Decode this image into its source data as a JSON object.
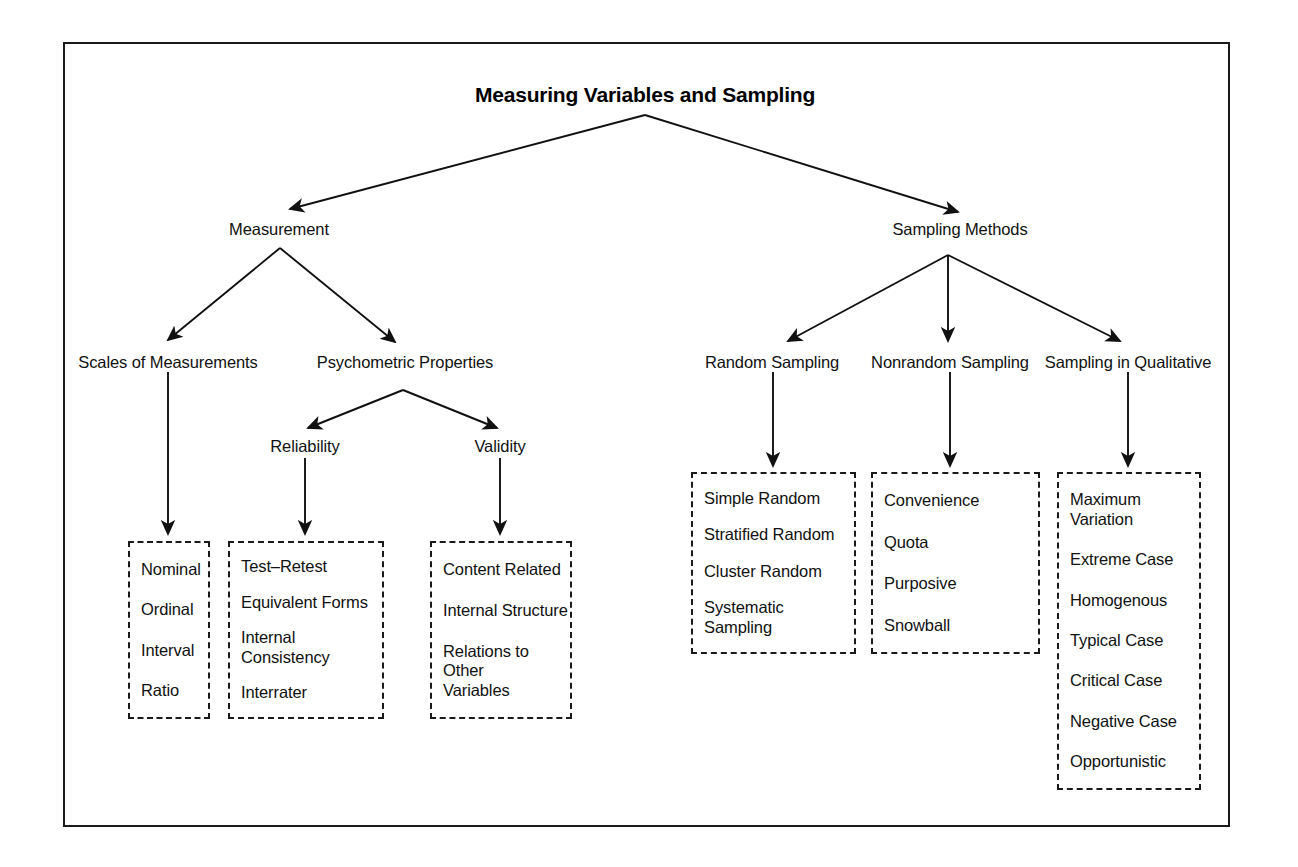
{
  "diagram": {
    "title": "Measuring Variables and Sampling",
    "nodes": {
      "measurement": "Measurement",
      "sampling_methods": "Sampling Methods",
      "scales_of_measurements": "Scales of Measurements",
      "psychometric_properties": "Psychometric Properties",
      "reliability": "Reliability",
      "validity": "Validity",
      "random_sampling": "Random Sampling",
      "nonrandom_sampling": "Nonrandom Sampling",
      "sampling_in_qualitative": "Sampling in Qualitative"
    },
    "boxes": {
      "scales": {
        "name": "Scales of Measurements",
        "items": [
          "Nominal",
          "Ordinal",
          "Interval",
          "Ratio"
        ]
      },
      "reliability": {
        "name": "Reliability",
        "items": [
          "Test–Retest",
          "Equivalent Forms",
          "Internal Consistency",
          "Interrater"
        ]
      },
      "validity": {
        "name": "Validity",
        "items": [
          "Content Related",
          "Internal Structure",
          "Relations to Other\nVariables"
        ]
      },
      "random": {
        "name": "Random Sampling",
        "items": [
          "Simple Random",
          "Stratified Random",
          "Cluster Random",
          "Systematic Sampling"
        ]
      },
      "nonrandom": {
        "name": "Nonrandom Sampling",
        "items": [
          "Convenience",
          "Quota",
          "Purposive",
          "Snowball"
        ]
      },
      "qualitative": {
        "name": "Sampling in Qualitative",
        "items": [
          "Maximum Variation",
          "Extreme Case",
          "Homogenous",
          "Typical Case",
          "Critical Case",
          "Negative Case",
          "Opportunistic"
        ]
      }
    },
    "colors": {
      "line": "#1a1a1a",
      "text": "#111111",
      "background": "#ffffff"
    }
  }
}
